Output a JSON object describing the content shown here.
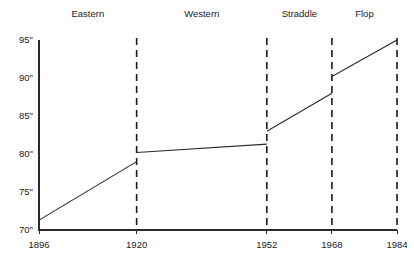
{
  "chart_data": {
    "type": "line",
    "title": "",
    "subtitle": "",
    "xlabel": "",
    "ylabel": "",
    "xlim": [
      1896,
      1984
    ],
    "ylim": [
      70,
      95
    ],
    "grid": false,
    "legend": "none",
    "y_tick_labels": [
      "95\"",
      "90\"",
      "85\"",
      "80\"",
      "75\"",
      "70\""
    ],
    "y_tick_values": [
      95,
      90,
      85,
      80,
      75,
      70
    ],
    "x_tick_labels": [
      "1896",
      "1920",
      "1952",
      "1968",
      "1984"
    ],
    "x_tick_values": [
      1896,
      1920,
      1952,
      1968,
      1984
    ],
    "era_labels": [
      "Eastern",
      "Western",
      "Straddle",
      "Flop"
    ],
    "era_ranges": [
      [
        1896,
        1920
      ],
      [
        1920,
        1952
      ],
      [
        1952,
        1968
      ],
      [
        1968,
        1984
      ]
    ],
    "divider_years": [
      1920,
      1952,
      1968,
      1984
    ],
    "segments": [
      {
        "era": "Eastern",
        "points": [
          {
            "x": 1896,
            "y": 71.3
          },
          {
            "x": 1920,
            "y": 79.0
          }
        ]
      },
      {
        "era": "Western",
        "points": [
          {
            "x": 1920,
            "y": 80.2
          },
          {
            "x": 1952,
            "y": 81.3
          }
        ]
      },
      {
        "era": "Straddle",
        "points": [
          {
            "x": 1952,
            "y": 83.0
          },
          {
            "x": 1968,
            "y": 88.0
          }
        ]
      },
      {
        "era": "Flop",
        "points": [
          {
            "x": 1968,
            "y": 90.2
          },
          {
            "x": 1984,
            "y": 95.0
          }
        ]
      }
    ],
    "colors": {
      "line": "#2b2b2b",
      "axis": "#2b2b2b",
      "divider": "#1a1a1a",
      "text": "#222222",
      "background": "#ffffff"
    }
  },
  "layout": {
    "plot_left": 39,
    "plot_right": 397,
    "plot_top": 40,
    "plot_bottom": 230,
    "era_label_y": 17,
    "x_tick_label_y": 248
  }
}
